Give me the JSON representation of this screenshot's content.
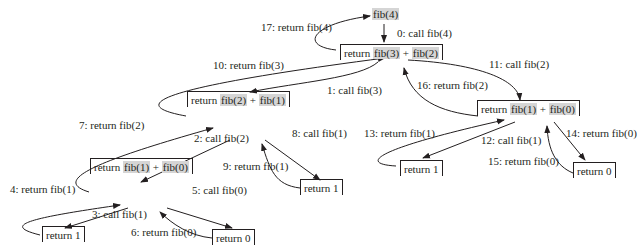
{
  "diagram": {
    "highlight_color": "#d5d5d5",
    "nodes": {
      "root": {
        "call": "fib(4)"
      },
      "n4": {
        "prefix": "return ",
        "left": "fib(3)",
        "op": " + ",
        "right": "fib(2)"
      },
      "n3": {
        "prefix": "return ",
        "left": "fib(2)",
        "op": " + ",
        "right": "fib(1)"
      },
      "n2": {
        "prefix": "return ",
        "left": "fib(1)",
        "op": " + ",
        "right": "fib(0)"
      },
      "n3_leaf": {
        "text": "return 1"
      },
      "n2_leaf1": {
        "text": "return 1"
      },
      "n2_leaf0": {
        "text": "return 0"
      },
      "r2": {
        "prefix": "return ",
        "left": "fib(1)",
        "op": " + ",
        "right": "fib(0)"
      },
      "r2_leaf1": {
        "text": "return 1"
      },
      "r2_leaf0": {
        "text": "return 0"
      }
    },
    "steps": [
      "0: call fib(4)",
      "1: call fib(3)",
      "2: call fib(2)",
      "3: call fib(1)",
      "4: return fib(1)",
      "5: call fib(0)",
      "6: return fib(0)",
      "7: return fib(2)",
      "8: call fib(1)",
      "9: return fib(1)",
      "10: return fib(3)",
      "11: call fib(2)",
      "12: call fib(1)",
      "13: return fib(1)",
      "14: return fib(0)",
      "15: return fib(0)",
      "16: return fib(2)",
      "17: return fib(4)"
    ]
  }
}
